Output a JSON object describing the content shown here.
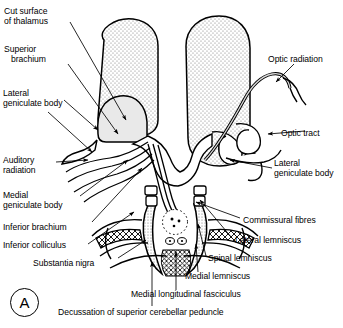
{
  "figure": {
    "panel_letter": "A"
  },
  "labels_left": [
    {
      "id": "cut-surface-of-thalamus",
      "text": "Cut surface\nof thalamus",
      "x": 4,
      "y": 6
    },
    {
      "id": "superior-brachium",
      "text": "Superior\n   brachium",
      "x": 4,
      "y": 44
    },
    {
      "id": "lateral-geniculate-body-left",
      "text": "Lateral\ngeniculate body",
      "x": 3,
      "y": 88
    },
    {
      "id": "auditory-radiation",
      "text": "Auditory\nradiation",
      "x": 3,
      "y": 155
    },
    {
      "id": "medial-geniculate-body",
      "text": "Medial\ngeniculate body",
      "x": 3,
      "y": 190
    },
    {
      "id": "inferior-brachium",
      "text": "Inferior brachium",
      "x": 3,
      "y": 222
    },
    {
      "id": "inferior-colliculus",
      "text": "Inferior colliculus",
      "x": 3,
      "y": 240
    },
    {
      "id": "substantia-nigra",
      "text": "Substantia nigra",
      "x": 33,
      "y": 258
    }
  ],
  "labels_right": [
    {
      "id": "optic-radiation",
      "text": "Optic radiation",
      "x": 268,
      "y": 54
    },
    {
      "id": "optic-tract",
      "text": "Optic tract",
      "x": 281,
      "y": 128
    },
    {
      "id": "lateral-geniculate-body-right",
      "text": "Lateral\ngeniculate body",
      "x": 274,
      "y": 158
    },
    {
      "id": "commissural-fibres",
      "text": "Commissural fibres",
      "x": 243,
      "y": 215
    },
    {
      "id": "lateral-lemniscus",
      "text": "Lateral lemniscus",
      "x": 235,
      "y": 235
    },
    {
      "id": "spinal-lemniscus",
      "text": "Spinal lemniscus",
      "x": 208,
      "y": 253
    },
    {
      "id": "medial-lemniscus",
      "text": "Medial lemniscus",
      "x": 185,
      "y": 271
    },
    {
      "id": "medial-longitudinal-fasciculus",
      "text": "Medial longitudinal fasciculus",
      "x": 131,
      "y": 289
    },
    {
      "id": "decussation-of-superior-cerebellar-peduncle",
      "text": "Decussation of superior cerebellar peduncle",
      "x": 58,
      "y": 307
    }
  ],
  "colors": {
    "ink": "#000000",
    "background": "#ffffff",
    "thalamus_stipple": "#8a8a8a",
    "geniculate_fill": "#e9e9e9",
    "tract_fill": "#d7d7d7"
  },
  "structures": [
    {
      "id": "thalamus-left",
      "name": "Cut surface of thalamus (left)",
      "texture": "stipple"
    },
    {
      "id": "thalamus-right",
      "name": "Cut surface of thalamus (right)",
      "texture": "stipple"
    },
    {
      "id": "lateral-geniculate-body-left-shape",
      "name": "Lateral geniculate body",
      "texture": "light-gray"
    },
    {
      "id": "optic-radiation-shape",
      "name": "Optic radiation",
      "texture": "outline"
    },
    {
      "id": "optic-tract-shape",
      "name": "Optic tract",
      "texture": "outline"
    },
    {
      "id": "cerebral-aqueduct",
      "name": "Cerebral aqueduct",
      "texture": "dotted-ring"
    },
    {
      "id": "decussation-crosshatch",
      "name": "Decussation of superior cerebellar peduncle",
      "texture": "crosshatch"
    },
    {
      "id": "substantia-nigra-band-left",
      "name": "Substantia nigra (left)",
      "texture": "crosshatch-band"
    },
    {
      "id": "substantia-nigra-band-right",
      "name": "Substantia nigra (right)",
      "texture": "crosshatch-band"
    },
    {
      "id": "lemniscus-band-left",
      "name": "Lemniscus band (left)",
      "texture": "stipple-band"
    },
    {
      "id": "lemniscus-band-right",
      "name": "Lemniscus band (right)",
      "texture": "stipple-band"
    }
  ]
}
